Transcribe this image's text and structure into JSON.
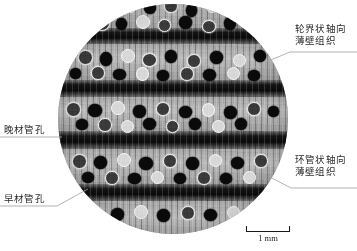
{
  "figure": {
    "type": "wood-anatomy-micrograph",
    "shape": "circular"
  },
  "annotations": [
    {
      "id": "latewood-pores",
      "text": "晚材管孔",
      "position": "left-upper"
    },
    {
      "id": "earlywood-pores",
      "text": "早材管孔",
      "position": "left-lower"
    },
    {
      "id": "boundary-axial-parenchyma",
      "line1": "轮界状轴向",
      "line2": "薄壁组织",
      "position": "right-upper"
    },
    {
      "id": "vasicentric-axial-parenchyma",
      "line1": "环管状轴向",
      "line2": "薄壁组织",
      "position": "right-lower"
    }
  ],
  "scale_bar": {
    "label": "1 mm",
    "value": 1,
    "unit": "mm"
  },
  "colors": {
    "text": "#2b2b2b",
    "leader_line": "#9a9a9a",
    "scale_bar": "#1a1a1a",
    "background": "#ffffff"
  }
}
